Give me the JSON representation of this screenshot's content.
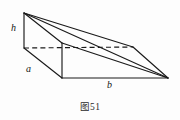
{
  "figure": {
    "caption": "图51",
    "labels": {
      "height": "h",
      "depth": "a",
      "base": "b"
    },
    "colors": {
      "stroke": "#1a1a1a",
      "background": "#fdfdfd",
      "text": "#151515"
    },
    "shape": {
      "type": "triangular-prism-wedge",
      "vertices": {
        "back_top": [
          24,
          13
        ],
        "back_bottom": [
          24,
          48
        ],
        "front_top": [
          62,
          43
        ],
        "front_bottom": [
          62,
          78
        ],
        "right_top": [
          133,
          47
        ],
        "right_apex": [
          168,
          78
        ]
      },
      "edges_visible": [
        [
          [
            24,
            13
          ],
          [
            24,
            48
          ]
        ],
        [
          [
            24,
            13
          ],
          [
            62,
            43
          ]
        ],
        [
          [
            24,
            13
          ],
          [
            133,
            47
          ]
        ],
        [
          [
            24,
            48
          ],
          [
            62,
            78
          ]
        ],
        [
          [
            62,
            43
          ],
          [
            62,
            78
          ]
        ],
        [
          [
            62,
            43
          ],
          [
            168,
            78
          ]
        ],
        [
          [
            62,
            78
          ],
          [
            168,
            78
          ]
        ],
        [
          [
            133,
            47
          ],
          [
            168,
            78
          ]
        ],
        [
          [
            24,
            13
          ],
          [
            168,
            78
          ]
        ]
      ],
      "edges_hidden": [
        [
          [
            24,
            48
          ],
          [
            133,
            47
          ]
        ]
      ]
    }
  }
}
